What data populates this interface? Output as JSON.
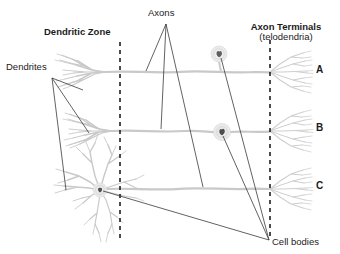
{
  "figure": {
    "title_labels": {
      "dendritic_zone": "Dendritic Zone",
      "axons": "Axons",
      "axon_terminals_line1": "Axon Terminals",
      "axon_terminals_line2": "(telodendria)",
      "dendrites": "Dendrites",
      "cell_bodies": "Cell bodies"
    },
    "row_labels": [
      {
        "letter": "A",
        "neuron_type": "unipolar-like-neuron"
      },
      {
        "letter": "B",
        "neuron_type": "bipolar-neuron"
      },
      {
        "letter": "C",
        "neuron_type": "multipolar-neuron"
      }
    ],
    "colors": {
      "text": "#1b1b1b",
      "neuron_structure": "#c9c9c9",
      "neuron_structure_dark": "#9a9a9a",
      "cell_body_halo": "#d8d8d8",
      "cell_body_nucleus": "#6e6e6e",
      "leader_line": "#3a3a3a",
      "dashed_divider": "#111111",
      "background": "#ffffff"
    },
    "dividers": [
      {
        "name": "dendritic-zone-boundary",
        "x": 120,
        "style": "dashed"
      },
      {
        "name": "axon-terminal-boundary",
        "x": 270,
        "style": "dashed"
      }
    ],
    "axon_baselines_y": [
      72,
      131,
      188
    ],
    "cell_body_positions": [
      {
        "row": "A",
        "x": 219,
        "y": 55,
        "placement": "offset-above-axon"
      },
      {
        "row": "B",
        "x": 222,
        "y": 132,
        "placement": "inline-on-axon"
      },
      {
        "row": "C",
        "x": 100,
        "y": 190,
        "placement": "dendritic-zone"
      }
    ]
  }
}
